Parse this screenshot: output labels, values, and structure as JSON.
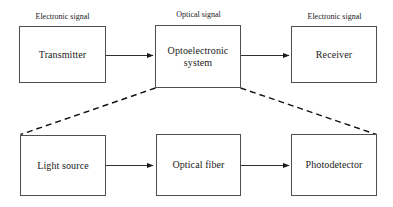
{
  "diagram": {
    "background_color": "#ffffff",
    "line_color": "#4f4f4f",
    "arrow_color": "#1a1a1a",
    "dashed_color": "#111111",
    "top_row": {
      "signal_labels": [
        {
          "id": "electronic-signal-left",
          "text": "Electronic signal"
        },
        {
          "id": "optical-signal",
          "text": "Optical signal"
        },
        {
          "id": "electronic-signal-right",
          "text": "Electronic signal"
        }
      ],
      "blocks": [
        {
          "id": "transmitter",
          "text": "Transmitter",
          "lines": [
            "Transmitter"
          ]
        },
        {
          "id": "optoelectronic-system",
          "text": "Optoelectronic system",
          "lines": [
            "Optoelectronic",
            "system"
          ]
        },
        {
          "id": "receiver",
          "text": "Receiver",
          "lines": [
            "Receiver"
          ]
        }
      ]
    },
    "bottom_row": {
      "blocks": [
        {
          "id": "light-source",
          "text": "Light source",
          "lines": [
            "Light source"
          ]
        },
        {
          "id": "optical-fiber",
          "text": "Optical fiber",
          "lines": [
            "Optical fiber"
          ]
        },
        {
          "id": "photodetector",
          "text": "Photodetector",
          "lines": [
            "Photodetector"
          ]
        }
      ]
    },
    "connectors": [
      {
        "id": "transmitter-to-optoelectronic",
        "from": "transmitter",
        "to": "optoelectronic-system",
        "style": "solid-arrow"
      },
      {
        "id": "optoelectronic-to-receiver",
        "from": "optoelectronic-system",
        "to": "receiver",
        "style": "solid-arrow"
      },
      {
        "id": "light-source-to-optical-fiber",
        "from": "light-source",
        "to": "optical-fiber",
        "style": "solid-arrow"
      },
      {
        "id": "optical-fiber-to-photodetector",
        "from": "optical-fiber",
        "to": "photodetector",
        "style": "solid-arrow"
      },
      {
        "id": "expansion-left",
        "from": "optoelectronic-system",
        "to": "light-source",
        "style": "dashed"
      },
      {
        "id": "expansion-right",
        "from": "optoelectronic-system",
        "to": "photodetector",
        "style": "dashed"
      }
    ]
  }
}
